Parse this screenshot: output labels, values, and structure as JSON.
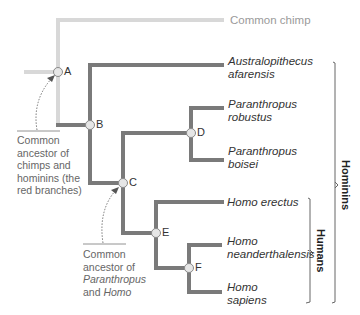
{
  "diagram": {
    "type": "phylogenetic-tree",
    "colors": {
      "chimp_branch": "#d8d8d8",
      "hominin_branch": "#7a7a7a",
      "node_fill": "#e6e6e6",
      "node_stroke": "#8a8a8a",
      "text": "#333333",
      "annotation": "#666666"
    },
    "taxa": [
      {
        "name": "Common chimp",
        "italic": false
      },
      {
        "name_line1": "Australopithecus",
        "name_line2": "afarensis",
        "italic": true
      },
      {
        "name_line1": "Paranthropus",
        "name_line2": "robustus",
        "italic": true
      },
      {
        "name_line1": "Paranthropus",
        "name_line2": "boisei",
        "italic": true
      },
      {
        "name": "Homo erectus",
        "italic": true
      },
      {
        "name_line1": "Homo",
        "name_line2": "neanderthalensis",
        "italic": true
      },
      {
        "name_line1": "Homo",
        "name_line2": "sapiens",
        "italic": true
      }
    ],
    "nodes": [
      "A",
      "B",
      "C",
      "D",
      "E",
      "F"
    ],
    "annotations": {
      "node_a": {
        "line1": "Common",
        "line2": "ancestor of",
        "line3": "chimps and",
        "line4": "hominins (the",
        "line5": "red branches)"
      },
      "node_c": {
        "line1": "Common",
        "line2": "ancestor of",
        "line3_italic": "Paranthropus",
        "line4_prefix": "and ",
        "line4_italic": "Homo"
      }
    },
    "groups": {
      "hominins": "Hominins",
      "humans": "Humans"
    }
  }
}
